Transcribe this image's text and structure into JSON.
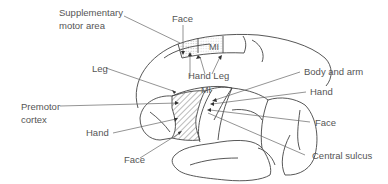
{
  "diagram": {
    "title": "",
    "upper_view": {
      "labels": {
        "sma": "Supplementary",
        "sma2": "motor area",
        "face": "Face",
        "mi": "MI",
        "hand_leg": "Hand Leg"
      }
    },
    "lateral_view": {
      "labels": {
        "leg": "Leg",
        "mi": "MI",
        "premotor": "Premotor",
        "premotor2": "cortex",
        "hand_left": "Hand",
        "face_left": "Face",
        "body_arm": "Body and arm",
        "hand_right": "Hand",
        "face_right": "Face",
        "central_sulcus": "Central sulcus"
      }
    },
    "colors": {
      "line": "#444444",
      "text": "#555555",
      "leader": "#666666"
    }
  }
}
